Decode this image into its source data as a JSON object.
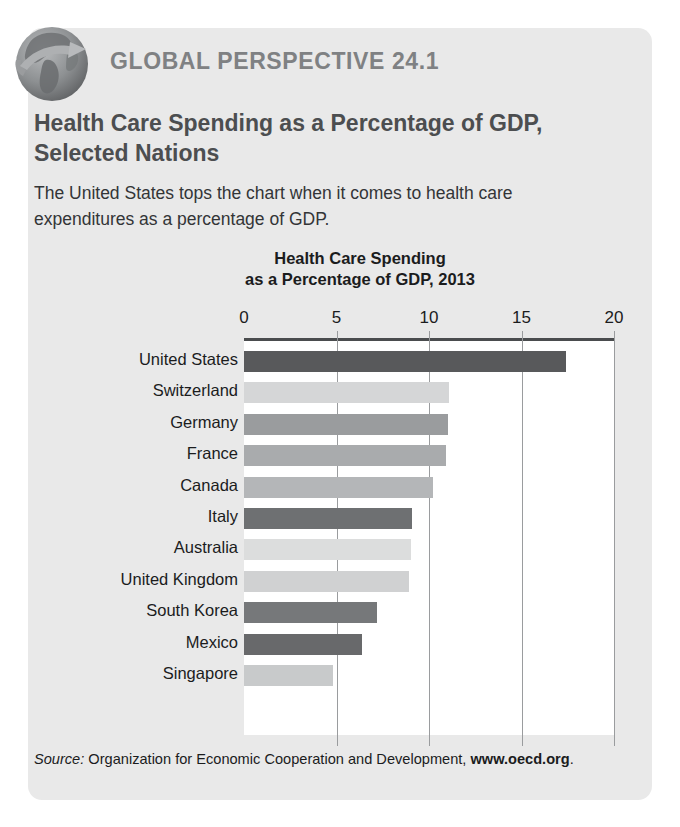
{
  "card": {
    "header_title": "GLOBAL PERSPECTIVE 24.1",
    "feature_title": "Health Care Spending as a Percentage of GDP, Selected Nations",
    "feature_description": "The United States tops the chart when it comes to health care expenditures as a percentage of GDP.",
    "icon": "globe-arrow-icon",
    "background_color": "#e9e9e9",
    "header_color": "#7f8183"
  },
  "source": {
    "label": "Source:",
    "text": "Organization for Economic Cooperation and Development,",
    "url": "www.oecd.org",
    "period": "."
  },
  "chart_data": {
    "type": "bar",
    "orientation": "horizontal",
    "title": "Health Care Spending as a Percentage of GDP, 2013",
    "title_line1": "Health Care Spending",
    "title_line2": "as a Percentage of GDP, 2013",
    "xlabel": "",
    "ylabel": "",
    "xlim": [
      0,
      20
    ],
    "ticks": [
      0,
      5,
      10,
      15,
      20
    ],
    "tick_labels": [
      "0",
      "5",
      "10",
      "15",
      "20"
    ],
    "grid": true,
    "legend": "none",
    "categories": [
      "United States",
      "Switzerland",
      "Germany",
      "France",
      "Canada",
      "Italy",
      "Australia",
      "United Kingdom",
      "South Korea",
      "Mexico",
      "Singapore"
    ],
    "values": [
      17.4,
      11.1,
      11.0,
      10.9,
      10.2,
      9.1,
      9.0,
      8.9,
      7.2,
      6.4,
      4.8
    ],
    "bar_colors": [
      "#58595b",
      "#d5d6d7",
      "#9a9c9e",
      "#a9abad",
      "#b4b6b8",
      "#6e7072",
      "#dcdddd",
      "#d0d1d2",
      "#76787a",
      "#68696b",
      "#c8cacb"
    ]
  }
}
